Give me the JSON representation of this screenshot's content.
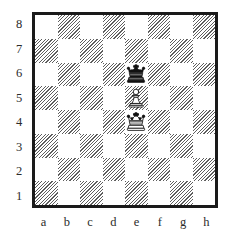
{
  "diagram": {
    "orientation": "white-bottom",
    "colors": {
      "light_square": "#ffffff",
      "dark_square_hatch": "#5e5e5e",
      "border": "#1a1a1a",
      "label_text": "#2b2b2b",
      "background": "#ffffff"
    }
  },
  "rank_labels": [
    "8",
    "7",
    "6",
    "5",
    "4",
    "3",
    "2",
    "1"
  ],
  "file_labels": [
    "a",
    "b",
    "c",
    "d",
    "e",
    "f",
    "g",
    "h"
  ],
  "chart_data": {
    "type": "table",
    "xlabel": "files",
    "ylabel": "ranks",
    "categories": [
      "a",
      "b",
      "c",
      "d",
      "e",
      "f",
      "g",
      "h"
    ],
    "ranks": [
      "8",
      "7",
      "6",
      "5",
      "4",
      "3",
      "2",
      "1"
    ],
    "board_orientation": "white-bottom",
    "square_colors_note": "a8 light, a1 dark; dark squares drawn as diagonal hatching",
    "pieces": [
      {
        "square": "e6",
        "piece": "king",
        "color": "black",
        "glyph": "black-king",
        "square_shade": "dark",
        "file": "e",
        "rank": "6"
      },
      {
        "square": "e5",
        "piece": "pawn",
        "color": "white",
        "glyph": "white-pawn",
        "square_shade": "light",
        "file": "e",
        "rank": "5"
      },
      {
        "square": "e4",
        "piece": "king",
        "color": "white",
        "glyph": "white-king",
        "square_shade": "dark",
        "file": "e",
        "rank": "4"
      }
    ],
    "fen_placement": "8/8/4k3/4P3/4K3/8/8/8",
    "piece_count": {
      "white": 2,
      "black": 1,
      "total": 3
    },
    "empty_squares": 61,
    "grid": [
      [
        "",
        "",
        "",
        "",
        "",
        "",
        "",
        ""
      ],
      [
        "",
        "",
        "",
        "",
        "",
        "",
        "",
        ""
      ],
      [
        "",
        "",
        "",
        "",
        "black-king",
        "",
        "",
        ""
      ],
      [
        "",
        "",
        "",
        "",
        "white-pawn",
        "",
        "",
        ""
      ],
      [
        "",
        "",
        "",
        "",
        "white-king",
        "",
        "",
        ""
      ],
      [
        "",
        "",
        "",
        "",
        "",
        "",
        "",
        ""
      ],
      [
        "",
        "",
        "",
        "",
        "",
        "",
        "",
        ""
      ],
      [
        "",
        "",
        "",
        "",
        "",
        "",
        "",
        ""
      ]
    ]
  }
}
